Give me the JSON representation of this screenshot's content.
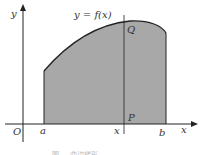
{
  "figure": {
    "curve_label": "y = f(x)",
    "axis_x_label": "x",
    "axis_y_label": "y",
    "origin_label": "O",
    "left_bound_label": "a",
    "right_bound_label": "b",
    "variable_point_label": "x",
    "top_point_label": "Q",
    "bottom_point_label": "P",
    "caption": "图 ... 曲边梯形",
    "colors": {
      "shade": "#a8a8a8",
      "curve": "#222222",
      "axis": "#222222",
      "background": "#ffffff"
    }
  }
}
